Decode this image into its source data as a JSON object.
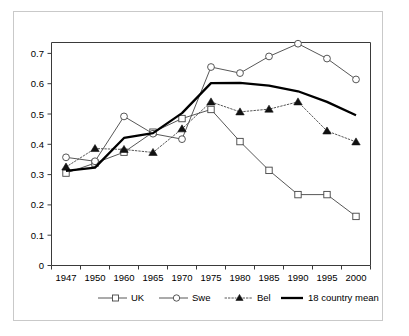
{
  "chart_data": {
    "type": "line",
    "title": "",
    "subtitle": "",
    "xlabel": "",
    "ylabel": "",
    "categories": [
      "1947",
      "1950",
      "1960",
      "1965",
      "1970",
      "1975",
      "1980",
      "1985",
      "1990",
      "1995",
      "2000"
    ],
    "ylim": [
      0,
      0.75
    ],
    "y_ticks": [
      "0",
      "0.1",
      "0.2",
      "0.3",
      "0.4",
      "0.5",
      "0.6",
      "0.7"
    ],
    "y_tick_values": [
      0,
      0.1,
      0.2,
      0.3,
      0.4,
      0.5,
      0.6,
      0.7
    ],
    "grid": false,
    "legend_position": "bottom",
    "axis_type": "category",
    "series": [
      {
        "name": "UK",
        "marker": "open-square",
        "line": "solid",
        "color": "#444444",
        "values": [
          0.305,
          0.338,
          0.374,
          0.44,
          0.485,
          0.515,
          0.409,
          0.314,
          0.234,
          0.234,
          0.162
        ]
      },
      {
        "name": "Swe",
        "marker": "open-circle",
        "line": "solid",
        "color": "#444444",
        "values": [
          0.357,
          0.344,
          0.492,
          0.435,
          0.417,
          0.655,
          0.635,
          0.69,
          0.732,
          0.683,
          0.614
        ]
      },
      {
        "name": "Bel",
        "marker": "filled-triangle",
        "line": "dotted",
        "color": "#111111",
        "values": [
          0.325,
          0.386,
          0.383,
          0.373,
          0.451,
          0.54,
          0.507,
          0.516,
          0.54,
          0.444,
          0.408
        ]
      },
      {
        "name": "18 country mean",
        "marker": "none",
        "line": "thick-solid",
        "color": "#000000",
        "values": [
          0.312,
          0.323,
          0.421,
          0.437,
          0.503,
          0.602,
          0.603,
          0.594,
          0.575,
          0.54,
          0.496
        ]
      }
    ]
  },
  "legend": {
    "items": [
      {
        "label": "UK"
      },
      {
        "label": "Swe"
      },
      {
        "label": "Bel"
      },
      {
        "label": "18 country mean"
      }
    ]
  },
  "axes": {
    "y_tick_0": "0",
    "y_tick_1": "0.1",
    "y_tick_2": "0.2",
    "y_tick_3": "0.3",
    "y_tick_4": "0.4",
    "y_tick_5": "0.5",
    "y_tick_6": "0.6",
    "y_tick_7": "0.7",
    "x_tick_0": "1947",
    "x_tick_1": "1950",
    "x_tick_2": "1960",
    "x_tick_3": "1965",
    "x_tick_4": "1970",
    "x_tick_5": "1975",
    "x_tick_6": "1980",
    "x_tick_7": "1985",
    "x_tick_8": "1990",
    "x_tick_9": "1995",
    "x_tick_10": "2000"
  }
}
